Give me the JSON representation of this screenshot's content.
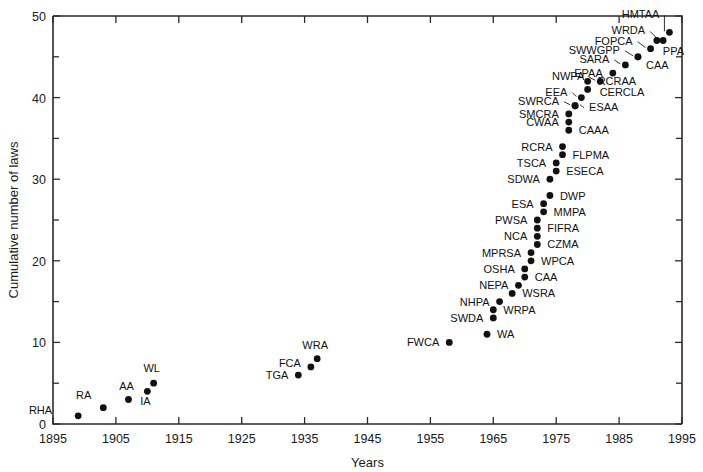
{
  "chart_data": {
    "type": "scatter",
    "title": "",
    "xlabel": "Years",
    "ylabel": "Cumulative number of laws",
    "xlim": [
      1895,
      1995
    ],
    "ylim": [
      0,
      50
    ],
    "xticks": [
      1895,
      1905,
      1915,
      1925,
      1935,
      1945,
      1955,
      1965,
      1975,
      1985,
      1995
    ],
    "yticks": [
      0,
      10,
      20,
      30,
      40,
      50
    ],
    "yticks_minor": [
      5,
      15,
      25,
      35,
      45
    ],
    "grid": false,
    "legend": false,
    "points": [
      {
        "label": "RHA",
        "x": 1899,
        "y": 1,
        "lx": -26,
        "ly": -2,
        "anchor": "end",
        "leader": false
      },
      {
        "label": "RA",
        "x": 1903,
        "y": 2,
        "lx": -12,
        "ly": -9,
        "anchor": "end",
        "leader": false
      },
      {
        "label": "AA",
        "x": 1907,
        "y": 3,
        "lx": -2,
        "ly": -10,
        "anchor": "middle",
        "leader": false
      },
      {
        "label": "IA",
        "x": 1910,
        "y": 4,
        "lx": -2,
        "ly": 14,
        "anchor": "middle",
        "leader": false
      },
      {
        "label": "WL",
        "x": 1911,
        "y": 5,
        "lx": -2,
        "ly": -11,
        "anchor": "middle",
        "leader": false
      },
      {
        "label": "TGA",
        "x": 1934,
        "y": 6,
        "lx": -10,
        "ly": 4,
        "anchor": "end",
        "leader": false
      },
      {
        "label": "FCA",
        "x": 1936,
        "y": 7,
        "lx": -10,
        "ly": 0,
        "anchor": "end",
        "leader": false
      },
      {
        "label": "WRA",
        "x": 1937,
        "y": 8,
        "lx": -2,
        "ly": -10,
        "anchor": "middle",
        "leader": false
      },
      {
        "label": "FWCA",
        "x": 1958,
        "y": 10,
        "lx": -10,
        "ly": 4,
        "anchor": "end",
        "leader": false
      },
      {
        "label": "WA",
        "x": 1964,
        "y": 11,
        "lx": 10,
        "ly": 4,
        "anchor": "start",
        "leader": false
      },
      {
        "label": "SWDA",
        "x": 1965,
        "y": 13,
        "lx": -10,
        "ly": 4,
        "anchor": "end",
        "leader": false
      },
      {
        "label": "WRPA",
        "x": 1965,
        "y": 14,
        "lx": 10,
        "ly": 4,
        "anchor": "start",
        "leader": false
      },
      {
        "label": "NHPA",
        "x": 1966,
        "y": 15,
        "lx": -10,
        "ly": 4,
        "anchor": "end",
        "leader": false
      },
      {
        "label": "WSRA",
        "x": 1968,
        "y": 16,
        "lx": 10,
        "ly": 4,
        "anchor": "start",
        "leader": false
      },
      {
        "label": "NEPA",
        "x": 1969,
        "y": 17,
        "lx": -10,
        "ly": 4,
        "anchor": "end",
        "leader": false
      },
      {
        "label": "CAA",
        "x": 1970,
        "y": 18,
        "lx": 10,
        "ly": 4,
        "anchor": "start",
        "leader": false
      },
      {
        "label": "OSHA",
        "x": 1970,
        "y": 19,
        "lx": -10,
        "ly": 4,
        "anchor": "end",
        "leader": false
      },
      {
        "label": "WPCA",
        "x": 1971,
        "y": 20,
        "lx": 10,
        "ly": 4,
        "anchor": "start",
        "leader": false
      },
      {
        "label": "MPRSA",
        "x": 1971,
        "y": 21,
        "lx": -10,
        "ly": 4,
        "anchor": "end",
        "leader": false
      },
      {
        "label": "CZMA",
        "x": 1972,
        "y": 22,
        "lx": 10,
        "ly": 4,
        "anchor": "start",
        "leader": false
      },
      {
        "label": "NCA",
        "x": 1972,
        "y": 23,
        "lx": -10,
        "ly": 4,
        "anchor": "end",
        "leader": false
      },
      {
        "label": "FIFRA",
        "x": 1972,
        "y": 24,
        "lx": 10,
        "ly": 4,
        "anchor": "start",
        "leader": false
      },
      {
        "label": "PWSA",
        "x": 1972,
        "y": 25,
        "lx": -10,
        "ly": 4,
        "anchor": "end",
        "leader": false
      },
      {
        "label": "MMPA",
        "x": 1973,
        "y": 26,
        "lx": 10,
        "ly": 4,
        "anchor": "start",
        "leader": false
      },
      {
        "label": "ESA",
        "x": 1973,
        "y": 27,
        "lx": -10,
        "ly": 4,
        "anchor": "end",
        "leader": false
      },
      {
        "label": "DWP",
        "x": 1974,
        "y": 28,
        "lx": 10,
        "ly": 4,
        "anchor": "start",
        "leader": false
      },
      {
        "label": "SDWA",
        "x": 1974,
        "y": 30,
        "lx": -10,
        "ly": 4,
        "anchor": "end",
        "leader": false
      },
      {
        "label": "ESECA",
        "x": 1975,
        "y": 31,
        "lx": 10,
        "ly": 4,
        "anchor": "start",
        "leader": false
      },
      {
        "label": "TSCA",
        "x": 1975,
        "y": 32,
        "lx": -10,
        "ly": 4,
        "anchor": "end",
        "leader": false
      },
      {
        "label": "FLPMA",
        "x": 1976,
        "y": 33,
        "lx": 10,
        "ly": 4,
        "anchor": "start",
        "leader": false
      },
      {
        "label": "RCRA",
        "x": 1976,
        "y": 34,
        "lx": -10,
        "ly": 4,
        "anchor": "end",
        "leader": false
      },
      {
        "label": "CAAA",
        "x": 1977,
        "y": 36,
        "lx": 10,
        "ly": 4,
        "anchor": "start",
        "leader": false
      },
      {
        "label": "CWAA",
        "x": 1977,
        "y": 37,
        "lx": -10,
        "ly": 4,
        "anchor": "end",
        "leader": false
      },
      {
        "label": "SMCRA",
        "x": 1977,
        "y": 38,
        "lx": -10,
        "ly": 4,
        "anchor": "end",
        "leader": false
      },
      {
        "label": "ESAA",
        "x": 1978,
        "y": 39,
        "lx": 14,
        "ly": 5,
        "anchor": "start",
        "leader": true
      },
      {
        "label": "SWRCA",
        "x": 1978,
        "y": 39,
        "lx": -16,
        "ly": -1,
        "anchor": "end",
        "leader": true
      },
      {
        "label": "EEA",
        "x": 1979,
        "y": 40,
        "lx": -14,
        "ly": -2,
        "anchor": "end",
        "leader": true
      },
      {
        "label": "CERCLA",
        "x": 1980,
        "y": 41,
        "lx": 12,
        "ly": 7,
        "anchor": "start",
        "leader": false
      },
      {
        "label": "RCRAA",
        "x": 1980,
        "y": 42,
        "lx": 10,
        "ly": 4,
        "anchor": "start",
        "leader": false
      },
      {
        "label": "NWPA",
        "x": 1982,
        "y": 42,
        "lx": -16,
        "ly": -1,
        "anchor": "end",
        "leader": true
      },
      {
        "label": "EPAA",
        "x": 1984,
        "y": 43,
        "lx": -10,
        "ly": 4,
        "anchor": "end",
        "leader": false
      },
      {
        "label": "SARA",
        "x": 1986,
        "y": 44,
        "lx": -16,
        "ly": -2,
        "anchor": "end",
        "leader": true
      },
      {
        "label": "CAA",
        "x": 1988,
        "y": 45,
        "lx": 8,
        "ly": 12,
        "anchor": "start",
        "leader": false
      },
      {
        "label": "SWWGPP",
        "x": 1988,
        "y": 45,
        "lx": -18,
        "ly": -3,
        "anchor": "end",
        "leader": true
      },
      {
        "label": "FOPCA",
        "x": 1990,
        "y": 46,
        "lx": -18,
        "ly": -4,
        "anchor": "end",
        "leader": true
      },
      {
        "label": "PPA",
        "x": 1991,
        "y": 47,
        "lx": 6,
        "ly": 15,
        "anchor": "start",
        "leader": false
      },
      {
        "label": "WRDA",
        "x": 1992,
        "y": 47,
        "lx": -18,
        "ly": -6,
        "anchor": "end",
        "leader": true
      },
      {
        "label": "HMTAA",
        "x": 1993,
        "y": 48,
        "lx": -10,
        "ly": -14,
        "anchor": "end",
        "leader": true
      },
      {
        "label": "NA",
        "x": 1994,
        "y": 49,
        "lx": 0,
        "ly": -40,
        "anchor": "middle",
        "leader": false,
        "hide": true
      }
    ]
  },
  "figure": {
    "ylabel_text": "Cumulative number of laws",
    "xlabel_text": "Years"
  }
}
